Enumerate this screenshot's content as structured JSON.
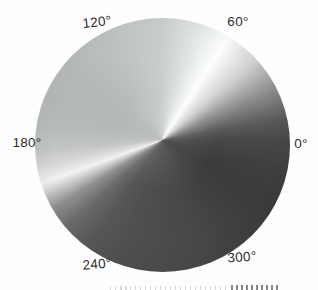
{
  "figure": {
    "background_color": "#fefefe",
    "label_color": "#2e2c2a",
    "labels": [
      {
        "angle_deg": 120,
        "text": "120°"
      },
      {
        "angle_deg": 60,
        "text": "60°"
      },
      {
        "angle_deg": 180,
        "text": "180°"
      },
      {
        "angle_deg": 0,
        "text": "0°"
      },
      {
        "angle_deg": 240,
        "text": "240°"
      },
      {
        "angle_deg": 300,
        "text": "300°"
      }
    ]
  },
  "chart_data": {
    "type": "heatmap",
    "subtype": "angular-grayscale-wheel",
    "title": "",
    "xlabel": "",
    "ylabel": "",
    "tick_labels": [
      "0°",
      "60°",
      "120°",
      "180°",
      "240°",
      "300°"
    ],
    "angle_range_deg": [
      0,
      360
    ],
    "legend_position": "none",
    "grid": false,
    "encoding": "brightness encodes azimuthal angle; white ridges near 57° and 200° (math angles, CCW from +x), darkest band near 330°–0°, light-gray plateau across the upper-left quadrant",
    "brightness_samples": [
      {
        "angle_deg": 57,
        "gray": 0.99
      },
      {
        "angle_deg": 40,
        "gray": 0.82
      },
      {
        "angle_deg": 25,
        "gray": 0.56
      },
      {
        "angle_deg": 10,
        "gray": 0.35
      },
      {
        "angle_deg": 0,
        "gray": 0.28
      },
      {
        "angle_deg": 345,
        "gray": 0.25
      },
      {
        "angle_deg": 330,
        "gray": 0.23
      },
      {
        "angle_deg": 310,
        "gray": 0.25
      },
      {
        "angle_deg": 290,
        "gray": 0.28
      },
      {
        "angle_deg": 270,
        "gray": 0.29
      },
      {
        "angle_deg": 250,
        "gray": 0.31
      },
      {
        "angle_deg": 235,
        "gray": 0.34
      },
      {
        "angle_deg": 222,
        "gray": 0.42
      },
      {
        "angle_deg": 212,
        "gray": 0.56
      },
      {
        "angle_deg": 205,
        "gray": 0.79
      },
      {
        "angle_deg": 200,
        "gray": 0.95
      },
      {
        "angle_deg": 193,
        "gray": 0.85
      },
      {
        "angle_deg": 185,
        "gray": 0.77
      },
      {
        "angle_deg": 160,
        "gray": 0.71
      },
      {
        "angle_deg": 120,
        "gray": 0.74
      },
      {
        "angle_deg": 90,
        "gray": 0.79
      },
      {
        "angle_deg": 75,
        "gray": 0.87
      },
      {
        "angle_deg": 65,
        "gray": 0.94
      }
    ],
    "conic_stops_css": [
      {
        "angle": 0,
        "color": "#c9cdce"
      },
      {
        "angle": 15,
        "color": "#dde1e2"
      },
      {
        "angle": 25,
        "color": "#eff2f2"
      },
      {
        "angle": 33,
        "color": "#fdfdfd"
      },
      {
        "angle": 50,
        "color": "#d0d0d0"
      },
      {
        "angle": 65,
        "color": "#8f8f8f"
      },
      {
        "angle": 80,
        "color": "#5a5a5a"
      },
      {
        "angle": 90,
        "color": "#484848"
      },
      {
        "angle": 105,
        "color": "#3f3f3f"
      },
      {
        "angle": 120,
        "color": "#3b3b3b"
      },
      {
        "angle": 140,
        "color": "#404040"
      },
      {
        "angle": 160,
        "color": "#474747"
      },
      {
        "angle": 180,
        "color": "#4b4b4b"
      },
      {
        "angle": 200,
        "color": "#505050"
      },
      {
        "angle": 215,
        "color": "#575757"
      },
      {
        "angle": 228,
        "color": "#6b6b6b"
      },
      {
        "angle": 238,
        "color": "#909090"
      },
      {
        "angle": 245,
        "color": "#c9c9c9"
      },
      {
        "angle": 250,
        "color": "#f2f2f2"
      },
      {
        "angle": 257,
        "color": "#d9d9d9"
      },
      {
        "angle": 265,
        "color": "#c3c5c5"
      },
      {
        "angle": 275,
        "color": "#b9bcbd"
      },
      {
        "angle": 290,
        "color": "#b3b7b8"
      },
      {
        "angle": 310,
        "color": "#b5b9ba"
      },
      {
        "angle": 330,
        "color": "#bcc0c1"
      },
      {
        "angle": 350,
        "color": "#c5c9ca"
      },
      {
        "angle": 360,
        "color": "#c9cdce"
      }
    ]
  }
}
